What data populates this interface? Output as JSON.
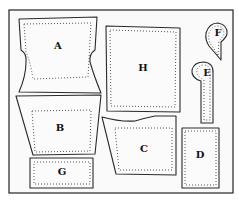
{
  "diagram": {
    "type": "sewing-pattern-layout",
    "pieces": [
      {
        "id": "A",
        "label": "A"
      },
      {
        "id": "B",
        "label": "B"
      },
      {
        "id": "C",
        "label": "C"
      },
      {
        "id": "D",
        "label": "D"
      },
      {
        "id": "E",
        "label": "E"
      },
      {
        "id": "F",
        "label": "F"
      },
      {
        "id": "G",
        "label": "G"
      },
      {
        "id": "H",
        "label": "H"
      }
    ]
  }
}
